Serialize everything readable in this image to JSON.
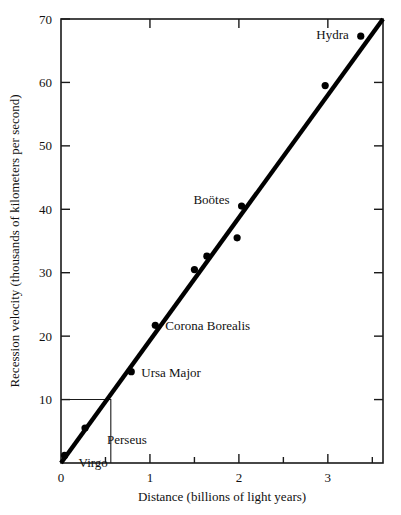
{
  "chart_data": {
    "type": "scatter",
    "title": "",
    "xlabel": "Distance (billions of light years)",
    "ylabel": "Recession velocity (thousands of kilometers per second)",
    "xlim": [
      0,
      3.62
    ],
    "ylim": [
      0,
      70
    ],
    "grid": false,
    "legend": "none",
    "x_major_ticks": [
      0,
      1,
      2,
      3
    ],
    "x_major_tick_labels": [
      "0",
      "1",
      "2",
      "3"
    ],
    "x_minor_ticks": [
      0.5,
      1.5,
      2.5,
      3.5
    ],
    "y_major_ticks": [
      10,
      20,
      30,
      40,
      50,
      60,
      70
    ],
    "y_major_tick_labels": [
      "10",
      "20",
      "30",
      "40",
      "50",
      "60",
      "70"
    ],
    "points": [
      {
        "name": "Virgo",
        "x": 0.04,
        "y": 1.2,
        "label": "Virgo",
        "label_dx": 14,
        "label_dy": 12,
        "anchor": "start"
      },
      {
        "name": "Perseus",
        "x": 0.27,
        "y": 5.5,
        "label": "Perseus",
        "label_dx": 22,
        "label_dy": 16,
        "anchor": "start"
      },
      {
        "name": "Ursa Major",
        "x": 0.79,
        "y": 14.4,
        "label": "Ursa Major",
        "label_dx": 10,
        "label_dy": 5,
        "anchor": "start"
      },
      {
        "name": "Corona Borealis",
        "x": 1.06,
        "y": 21.7,
        "label": "Corona Borealis",
        "label_dx": 10,
        "label_dy": 5,
        "anchor": "start"
      },
      {
        "name": "unlabeled-1",
        "x": 1.5,
        "y": 30.5,
        "label": "",
        "label_dx": 0,
        "label_dy": 0,
        "anchor": "start"
      },
      {
        "name": "unlabeled-2",
        "x": 1.64,
        "y": 32.6,
        "label": "",
        "label_dx": 0,
        "label_dy": 0,
        "anchor": "start"
      },
      {
        "name": "Bootes",
        "x": 2.03,
        "y": 40.5,
        "label": "Boötes",
        "label_dx": -12,
        "label_dy": -2,
        "anchor": "end"
      },
      {
        "name": "unlabeled-3",
        "x": 1.98,
        "y": 35.5,
        "label": "",
        "label_dx": 0,
        "label_dy": 0,
        "anchor": "start"
      },
      {
        "name": "unlabeled-4",
        "x": 2.97,
        "y": 59.5,
        "label": "",
        "label_dx": 0,
        "label_dy": 0,
        "anchor": "start"
      },
      {
        "name": "Hydra",
        "x": 3.37,
        "y": 67.3,
        "label": "Hydra",
        "label_dx": -12,
        "label_dy": 3,
        "anchor": "end"
      }
    ],
    "fit_line": {
      "x0": 0.0,
      "y0": 0.0,
      "x1": 3.62,
      "y1": 70.0
    },
    "inset_box": {
      "x0": 0.0,
      "y0": 0.0,
      "x1": 0.56,
      "y1": 10.0
    },
    "colors": {
      "ink": "#1a1a1a",
      "marker": "#000000",
      "line": "#000000",
      "background": "#ffffff"
    }
  }
}
